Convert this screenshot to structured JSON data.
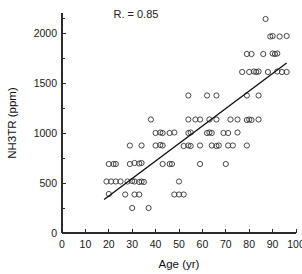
{
  "chart_data": {
    "type": "scatter",
    "title": "",
    "xlabel": "Age (yr)",
    "ylabel": "NH3TR (ppm)",
    "xlim": [
      0,
      100
    ],
    "ylim": [
      0,
      2200
    ],
    "xticks": [
      0,
      10,
      20,
      30,
      40,
      50,
      60,
      70,
      80,
      90,
      100
    ],
    "xtick_labels": [
      "0",
      "10",
      "20",
      "30",
      "40",
      "50",
      "60",
      "70",
      "80",
      "90",
      "100"
    ],
    "yticks": [
      0,
      500,
      1000,
      1500,
      2000
    ],
    "ytick_labels": [
      "0",
      "500",
      "1000",
      "1500",
      "2000"
    ],
    "yticks_minor": [
      250,
      750,
      1250,
      1750,
      2150
    ],
    "grid": false,
    "legend": false,
    "marker": "open-circle",
    "marker_color": "#333333",
    "annotations": [
      {
        "text": "R. = 0.85",
        "x": 22,
        "y": 2150
      }
    ],
    "fit_line": {
      "type": "linear",
      "x_start": 18,
      "y_start": 335,
      "x_end": 96,
      "y_end": 1700,
      "slope": 17.5,
      "intercept": 20,
      "color": "#111111"
    },
    "points": [
      {
        "x": 20,
        "y": 690
      },
      {
        "x": 22,
        "y": 690
      },
      {
        "x": 23,
        "y": 690
      },
      {
        "x": 29,
        "y": 690
      },
      {
        "x": 31,
        "y": 700
      },
      {
        "x": 33,
        "y": 695
      },
      {
        "x": 34,
        "y": 700
      },
      {
        "x": 43,
        "y": 690
      },
      {
        "x": 46,
        "y": 690
      },
      {
        "x": 47,
        "y": 690
      },
      {
        "x": 59,
        "y": 690
      },
      {
        "x": 70,
        "y": 690
      },
      {
        "x": 19,
        "y": 515
      },
      {
        "x": 21,
        "y": 515
      },
      {
        "x": 23,
        "y": 515
      },
      {
        "x": 25,
        "y": 515
      },
      {
        "x": 28,
        "y": 515
      },
      {
        "x": 30,
        "y": 520
      },
      {
        "x": 31,
        "y": 515
      },
      {
        "x": 33,
        "y": 510
      },
      {
        "x": 34,
        "y": 515
      },
      {
        "x": 35,
        "y": 510
      },
      {
        "x": 50,
        "y": 515
      },
      {
        "x": 20,
        "y": 390
      },
      {
        "x": 27,
        "y": 385
      },
      {
        "x": 31,
        "y": 385
      },
      {
        "x": 33,
        "y": 385
      },
      {
        "x": 48,
        "y": 385
      },
      {
        "x": 50,
        "y": 385
      },
      {
        "x": 52,
        "y": 385
      },
      {
        "x": 30,
        "y": 250
      },
      {
        "x": 37,
        "y": 250
      },
      {
        "x": 29,
        "y": 875
      },
      {
        "x": 34,
        "y": 875
      },
      {
        "x": 40,
        "y": 875
      },
      {
        "x": 42,
        "y": 880
      },
      {
        "x": 43,
        "y": 875
      },
      {
        "x": 52,
        "y": 870
      },
      {
        "x": 54,
        "y": 875
      },
      {
        "x": 55,
        "y": 870
      },
      {
        "x": 59,
        "y": 875
      },
      {
        "x": 64,
        "y": 875
      },
      {
        "x": 66,
        "y": 870
      },
      {
        "x": 67,
        "y": 875
      },
      {
        "x": 71,
        "y": 875
      },
      {
        "x": 73,
        "y": 875
      },
      {
        "x": 79,
        "y": 875
      },
      {
        "x": 40,
        "y": 1000
      },
      {
        "x": 42,
        "y": 1005
      },
      {
        "x": 43,
        "y": 1000
      },
      {
        "x": 46,
        "y": 1000
      },
      {
        "x": 48,
        "y": 1005
      },
      {
        "x": 54,
        "y": 1000
      },
      {
        "x": 55,
        "y": 1005
      },
      {
        "x": 62,
        "y": 1000
      },
      {
        "x": 63,
        "y": 1005
      },
      {
        "x": 64,
        "y": 1000
      },
      {
        "x": 69,
        "y": 1000
      },
      {
        "x": 71,
        "y": 1000
      },
      {
        "x": 75,
        "y": 1005
      },
      {
        "x": 38,
        "y": 1135
      },
      {
        "x": 54,
        "y": 1135
      },
      {
        "x": 57,
        "y": 1135
      },
      {
        "x": 59,
        "y": 1135
      },
      {
        "x": 63,
        "y": 1135
      },
      {
        "x": 66,
        "y": 1135
      },
      {
        "x": 72,
        "y": 1135
      },
      {
        "x": 75,
        "y": 1135
      },
      {
        "x": 79,
        "y": 1130
      },
      {
        "x": 80,
        "y": 1135
      },
      {
        "x": 81,
        "y": 1130
      },
      {
        "x": 84,
        "y": 1135
      },
      {
        "x": 54,
        "y": 1375
      },
      {
        "x": 62,
        "y": 1375
      },
      {
        "x": 66,
        "y": 1375
      },
      {
        "x": 79,
        "y": 1375
      },
      {
        "x": 84,
        "y": 1375
      },
      {
        "x": 77,
        "y": 1610
      },
      {
        "x": 80,
        "y": 1610
      },
      {
        "x": 82,
        "y": 1615
      },
      {
        "x": 83,
        "y": 1610
      },
      {
        "x": 84,
        "y": 1615
      },
      {
        "x": 88,
        "y": 1610
      },
      {
        "x": 92,
        "y": 1615
      },
      {
        "x": 94,
        "y": 1610
      },
      {
        "x": 96,
        "y": 1610
      },
      {
        "x": 79,
        "y": 1790
      },
      {
        "x": 81,
        "y": 1790
      },
      {
        "x": 86,
        "y": 1790
      },
      {
        "x": 90,
        "y": 1795
      },
      {
        "x": 91,
        "y": 1790
      },
      {
        "x": 92,
        "y": 1795
      },
      {
        "x": 89,
        "y": 1965
      },
      {
        "x": 90,
        "y": 1970
      },
      {
        "x": 93,
        "y": 1965
      },
      {
        "x": 96,
        "y": 1970
      },
      {
        "x": 87,
        "y": 2140
      }
    ]
  },
  "geometry": {
    "plot_left": 62,
    "plot_right": 296,
    "plot_bottom": 233,
    "plot_top": 13,
    "marker_radius": 2.6,
    "tick_len_major": 4,
    "tick_len_minor": 2.5
  }
}
